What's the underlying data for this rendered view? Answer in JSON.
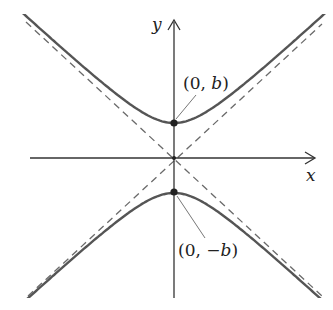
{
  "figure": {
    "type": "hyperbola",
    "equation_form": "y^2/b^2 - x^2/a^2 = 1",
    "colors": {
      "curve": "#555555",
      "asymptote": "#6a6a6a",
      "axis": "#333333",
      "point": "#222222",
      "leader": "#777777"
    }
  },
  "axes": {
    "x_label": "x",
    "y_label": "y"
  },
  "points": [
    {
      "label": "(0, b)",
      "prefix": "(0, ",
      "var": "b",
      "suffix": ")"
    },
    {
      "label": "(0, −b)",
      "prefix": "(0, −",
      "var": "b",
      "suffix": ")"
    }
  ]
}
